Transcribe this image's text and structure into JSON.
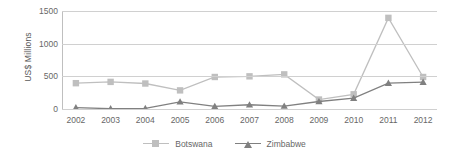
{
  "chart_data": {
    "type": "line",
    "title": "",
    "xlabel": "",
    "ylabel": "US$ Millions",
    "categories": [
      "2002",
      "2003",
      "2004",
      "2005",
      "2006",
      "2007",
      "2008",
      "2009",
      "2010",
      "2011",
      "2012"
    ],
    "ylim": [
      0,
      1500
    ],
    "yticks": [
      0,
      500,
      1000,
      1500
    ],
    "ytick_labels": [
      "0",
      "500",
      "1000",
      "1500"
    ],
    "grid": true,
    "legend_position": "bottom",
    "series": [
      {
        "name": "Botswana",
        "color": "#bfbfbf",
        "marker": "square",
        "values": [
          395,
          415,
          390,
          285,
          490,
          500,
          530,
          145,
          225,
          1395,
          490
        ]
      },
      {
        "name": "Zimbabwe",
        "color": "#808080",
        "marker": "triangle",
        "values": [
          20,
          5,
          10,
          110,
          40,
          65,
          45,
          115,
          165,
          395,
          410
        ]
      }
    ]
  }
}
